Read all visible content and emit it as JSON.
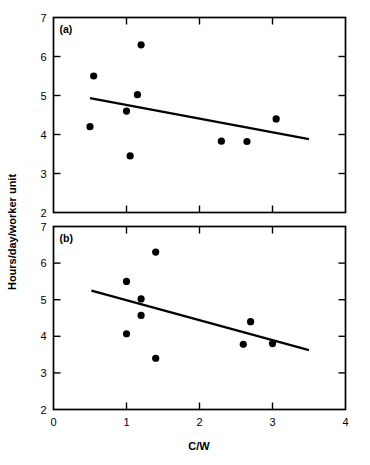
{
  "figure": {
    "ylabel": "Hours/day/worker unit",
    "xlabel": "C/W",
    "panel_a_label": "(a)",
    "panel_b_label": "(b)",
    "marker_color": "#000000",
    "line_color": "#000000",
    "frame_color": "#000000",
    "background": "#ffffff"
  },
  "axis": {
    "x_ticks": [
      "0",
      "1",
      "2",
      "3",
      "4"
    ],
    "y_ticks": [
      "2",
      "3",
      "4",
      "5",
      "6",
      "7"
    ]
  },
  "chart_data": [
    {
      "type": "scatter",
      "title": "(a)",
      "xlabel": "C/W",
      "ylabel": "Hours/day/worker unit",
      "xlim": [
        0,
        4
      ],
      "ylim": [
        2,
        7
      ],
      "xticks": [
        0,
        1,
        2,
        3,
        4
      ],
      "yticks": [
        2,
        3,
        4,
        5,
        6,
        7
      ],
      "grid": false,
      "legend": "none",
      "points": [
        {
          "x": 0.5,
          "y": 4.2
        },
        {
          "x": 0.55,
          "y": 5.5
        },
        {
          "x": 1.0,
          "y": 4.6
        },
        {
          "x": 1.05,
          "y": 3.45
        },
        {
          "x": 1.15,
          "y": 5.02
        },
        {
          "x": 1.2,
          "y": 6.3
        },
        {
          "x": 2.3,
          "y": 3.83
        },
        {
          "x": 2.65,
          "y": 3.82
        },
        {
          "x": 3.05,
          "y": 4.4
        }
      ],
      "fit_line": {
        "x0": 0.5,
        "y0": 4.93,
        "x1": 3.5,
        "y1": 3.88
      }
    },
    {
      "type": "scatter",
      "title": "(b)",
      "xlabel": "C/W",
      "ylabel": "Hours/day/worker unit",
      "xlim": [
        0,
        4
      ],
      "ylim": [
        2,
        7
      ],
      "xticks": [
        0,
        1,
        2,
        3,
        4
      ],
      "yticks": [
        2,
        3,
        4,
        5,
        6,
        7
      ],
      "grid": false,
      "legend": "none",
      "points": [
        {
          "x": 1.0,
          "y": 4.07
        },
        {
          "x": 1.0,
          "y": 5.5
        },
        {
          "x": 1.2,
          "y": 5.02
        },
        {
          "x": 1.2,
          "y": 4.57
        },
        {
          "x": 1.4,
          "y": 6.3
        },
        {
          "x": 1.4,
          "y": 3.4
        },
        {
          "x": 2.6,
          "y": 3.78
        },
        {
          "x": 2.7,
          "y": 4.4
        },
        {
          "x": 3.0,
          "y": 3.8
        }
      ],
      "fit_line": {
        "x0": 0.52,
        "y0": 5.25,
        "x1": 3.5,
        "y1": 3.62
      }
    }
  ]
}
